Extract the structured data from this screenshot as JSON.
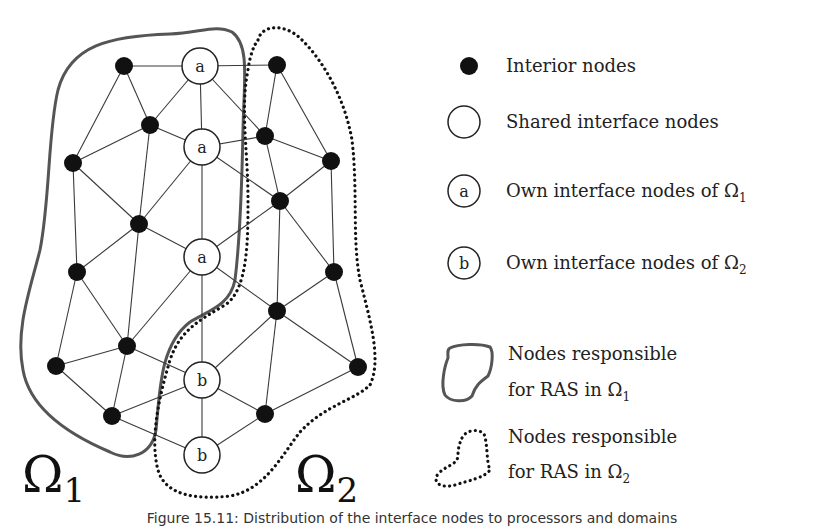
{
  "diagram": {
    "domains": [
      {
        "symbol": "Ω",
        "subscript": "1",
        "label": "Ω1"
      },
      {
        "symbol": "Ω",
        "subscript": "2",
        "label": "Ω2"
      }
    ],
    "node_labels": {
      "own_omega1": "a",
      "own_omega2": "b"
    },
    "nodes": [
      {
        "id": "L1",
        "type": "interior",
        "x": 124,
        "y": 66
      },
      {
        "id": "L2",
        "type": "interior",
        "x": 150,
        "y": 125
      },
      {
        "id": "L3",
        "type": "interior",
        "x": 73,
        "y": 163
      },
      {
        "id": "L4",
        "type": "interior",
        "x": 139,
        "y": 224
      },
      {
        "id": "L5",
        "type": "interior",
        "x": 77,
        "y": 272
      },
      {
        "id": "L6",
        "type": "interior",
        "x": 127,
        "y": 346
      },
      {
        "id": "L7",
        "type": "interior",
        "x": 56,
        "y": 366
      },
      {
        "id": "L8",
        "type": "interior",
        "x": 112,
        "y": 416
      },
      {
        "id": "A1",
        "type": "own_omega1",
        "label": "a",
        "x": 200,
        "y": 66
      },
      {
        "id": "A2",
        "type": "own_omega1",
        "label": "a",
        "x": 202,
        "y": 147
      },
      {
        "id": "A3",
        "type": "own_omega1",
        "label": "a",
        "x": 202,
        "y": 257
      },
      {
        "id": "B1",
        "type": "own_omega2",
        "label": "b",
        "x": 202,
        "y": 380
      },
      {
        "id": "B2",
        "type": "own_omega2",
        "label": "b",
        "x": 202,
        "y": 455
      },
      {
        "id": "R1",
        "type": "interior",
        "x": 277,
        "y": 65
      },
      {
        "id": "R2",
        "type": "interior",
        "x": 265,
        "y": 136
      },
      {
        "id": "R3",
        "type": "interior",
        "x": 331,
        "y": 161
      },
      {
        "id": "R4",
        "type": "interior",
        "x": 280,
        "y": 201
      },
      {
        "id": "R5",
        "type": "interior",
        "x": 334,
        "y": 272
      },
      {
        "id": "R6",
        "type": "interior",
        "x": 277,
        "y": 311
      },
      {
        "id": "R7",
        "type": "interior",
        "x": 358,
        "y": 367
      },
      {
        "id": "R8",
        "type": "interior",
        "x": 265,
        "y": 414
      }
    ],
    "edges": [
      [
        "L1",
        "A1"
      ],
      [
        "L1",
        "L2"
      ],
      [
        "L1",
        "L3"
      ],
      [
        "L2",
        "A1"
      ],
      [
        "L2",
        "A2"
      ],
      [
        "L2",
        "L3"
      ],
      [
        "L2",
        "L4"
      ],
      [
        "L3",
        "L4"
      ],
      [
        "L4",
        "A2"
      ],
      [
        "L4",
        "A3"
      ],
      [
        "L3",
        "L5"
      ],
      [
        "L4",
        "L5"
      ],
      [
        "L4",
        "L6"
      ],
      [
        "L5",
        "L6"
      ],
      [
        "A3",
        "L6"
      ],
      [
        "L6",
        "B1"
      ],
      [
        "L6",
        "L7"
      ],
      [
        "L6",
        "L8"
      ],
      [
        "L5",
        "L7"
      ],
      [
        "L7",
        "L8"
      ],
      [
        "L8",
        "B1"
      ],
      [
        "L8",
        "B2"
      ],
      [
        "A1",
        "A2"
      ],
      [
        "A2",
        "A3"
      ],
      [
        "A3",
        "B1"
      ],
      [
        "B1",
        "B2"
      ],
      [
        "A1",
        "R1"
      ],
      [
        "A1",
        "R2"
      ],
      [
        "R1",
        "R2"
      ],
      [
        "R1",
        "R3"
      ],
      [
        "A2",
        "R2"
      ],
      [
        "R2",
        "R3"
      ],
      [
        "R2",
        "R4"
      ],
      [
        "A2",
        "R4"
      ],
      [
        "R3",
        "R4"
      ],
      [
        "R4",
        "R5"
      ],
      [
        "R3",
        "R5"
      ],
      [
        "A3",
        "R4"
      ],
      [
        "R4",
        "R6"
      ],
      [
        "A3",
        "R6"
      ],
      [
        "R5",
        "R6"
      ],
      [
        "R6",
        "B1"
      ],
      [
        "R6",
        "R7"
      ],
      [
        "R5",
        "R7"
      ],
      [
        "R6",
        "R8"
      ],
      [
        "B1",
        "R8"
      ],
      [
        "R7",
        "R8"
      ],
      [
        "B2",
        "R8"
      ]
    ]
  },
  "legend": {
    "items": [
      {
        "marker": "filled-circle",
        "text": "Interior nodes"
      },
      {
        "marker": "empty-circle",
        "text": "Shared interface nodes"
      },
      {
        "marker": "circle-a",
        "marker_label": "a",
        "text": "Own interface nodes of Ω",
        "subscript": "1"
      },
      {
        "marker": "circle-b",
        "marker_label": "b",
        "text": "Own interface nodes of Ω",
        "subscript": "2"
      },
      {
        "marker": "solid-blob",
        "line1": "Nodes responsible",
        "line2": "for RAS in Ω",
        "subscript": "1"
      },
      {
        "marker": "dotted-blob",
        "line1": "Nodes responsible",
        "line2": "for RAS in Ω",
        "subscript": "2"
      }
    ]
  },
  "caption": "Figure 15.11: Distribution of the interface nodes to processors and domains"
}
